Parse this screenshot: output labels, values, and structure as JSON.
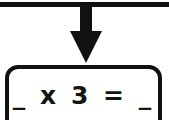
{
  "diagram": {
    "type": "flowchart-node",
    "connector": {
      "bar_label": "horizontal-connector-bar",
      "arrow_label": "downward-arrow",
      "direction": "down"
    },
    "node": {
      "shape": "rounded-rectangle",
      "equation": "_ x 3 = _",
      "operands": {
        "left_blank": "_",
        "operator": "x",
        "right_operand": "3",
        "equals": "=",
        "result_blank": "_"
      }
    },
    "colors": {
      "ink": "#111111",
      "background": "#ffffff",
      "text": "#141414"
    }
  }
}
